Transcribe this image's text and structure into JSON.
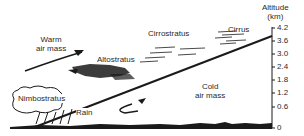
{
  "labels": {
    "warm_air_mass": "Warm\nair mass",
    "warm_line1": "Warm",
    "warm_line2": "air mass",
    "cold_line1": "Cold",
    "cold_line2": "air mass",
    "altostratus": "Altostratus",
    "cirrostratus": "Cirrostratus",
    "cirrus": "Cirrus",
    "nimbostratus": "Nimbostratus",
    "rain": "Rain"
  },
  "axis": {
    "title_line1": "Altitude",
    "title_line2": "(km)",
    "ticks": [
      "4.2",
      "3.6",
      "3.0",
      "2.4",
      "1.8",
      "1.2",
      "0.6",
      "0"
    ]
  },
  "colors": {
    "ink": "#1a1a1a",
    "background": "#ffffff"
  }
}
